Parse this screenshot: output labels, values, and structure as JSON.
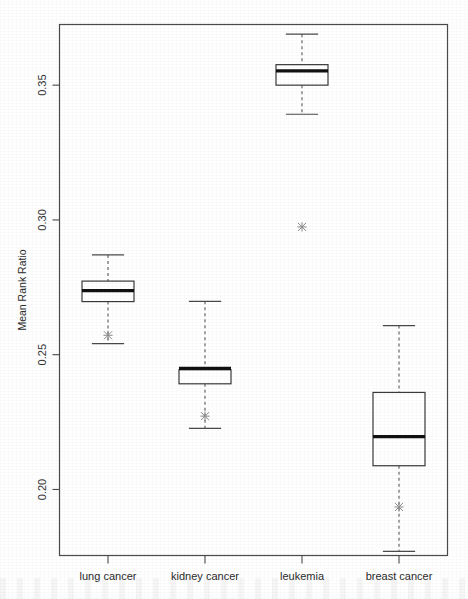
{
  "chart_data": {
    "type": "box",
    "title": "",
    "subtitle": "",
    "xlabel": "",
    "ylabel": "Mean Rank Ratio",
    "categories": [
      "lung cancer",
      "kidney cancer",
      "leukemia",
      "breast cancer"
    ],
    "ylim": [
      0.1755,
      0.3725
    ],
    "yticks": [
      0.2,
      0.25,
      0.3,
      0.35
    ],
    "ytick_labels": [
      "0.20",
      "0.25",
      "0.30",
      "0.35"
    ],
    "grid": false,
    "legend": null,
    "legend_position": "none",
    "boxes": [
      {
        "category": "lung cancer",
        "whisker_low": 0.2541,
        "q1": 0.2697,
        "median": 0.2738,
        "q3": 0.2773,
        "whisker_high": 0.287,
        "outliers": [
          0.2572
        ]
      },
      {
        "category": "kidney cancer",
        "whisker_low": 0.2227,
        "q1": 0.2392,
        "median": 0.2449,
        "q3": 0.2444,
        "whisker_high": 0.2698,
        "outliers": [
          0.2272
        ]
      },
      {
        "category": "leukemia",
        "whisker_low": 0.3392,
        "q1": 0.35,
        "median": 0.3553,
        "q3": 0.3576,
        "whisker_high": 0.3689,
        "outliers": [
          0.2974
        ]
      },
      {
        "category": "breast cancer",
        "whisker_low": 0.177,
        "q1": 0.2088,
        "median": 0.2196,
        "q3": 0.236,
        "whisker_high": 0.2608,
        "outliers": [
          0.1935
        ]
      }
    ]
  },
  "axis": {
    "y_title": "Mean Rank Ratio"
  }
}
